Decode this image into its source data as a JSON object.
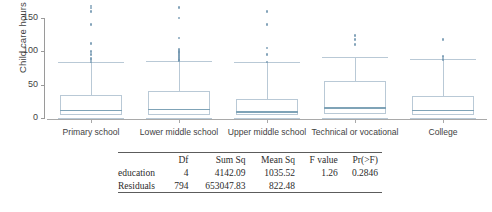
{
  "chart_data": {
    "type": "box",
    "title": "",
    "xlabel": "",
    "ylabel": "Child care hours",
    "ylim": [
      0,
      175
    ],
    "yticks": [
      0,
      50,
      100,
      150
    ],
    "ytick_labels": [
      "0",
      "50",
      "100",
      "150"
    ],
    "grid": false,
    "legend": "none",
    "categories": [
      "Primary school",
      "Lower middle school",
      "Upper middle school",
      "Technical or vocational",
      "College"
    ],
    "boxes": [
      {
        "category": "Primary school",
        "min": 0,
        "q1": 5,
        "median": 12,
        "q3": 35,
        "upper_whisker": 84,
        "outliers": [
          84,
          88,
          90,
          95,
          100,
          112,
          140,
          160,
          165,
          168
        ]
      },
      {
        "category": "Lower middle school",
        "min": 0,
        "q1": 5,
        "median": 14,
        "q3": 40,
        "upper_whisker": 86,
        "outliers": [
          86,
          88,
          90,
          92,
          95,
          98,
          100,
          103,
          120,
          150,
          166
        ]
      },
      {
        "category": "Upper middle school",
        "min": 0,
        "q1": 4,
        "median": 10,
        "q3": 28,
        "upper_whisker": 84,
        "outliers": [
          84,
          95,
          105,
          140,
          160
        ]
      },
      {
        "category": "Technical or vocational",
        "min": 0,
        "q1": 6,
        "median": 16,
        "q3": 56,
        "upper_whisker": 92,
        "outliers": [
          110,
          118,
          124
        ]
      },
      {
        "category": "College",
        "min": 0,
        "q1": 5,
        "median": 12,
        "q3": 33,
        "upper_whisker": 88,
        "outliers": [
          88,
          92,
          118
        ]
      }
    ]
  },
  "anova": {
    "columns": [
      "",
      "Df",
      "Sum Sq",
      "Mean Sq",
      "F value",
      "Pr(>F)"
    ],
    "rows": [
      {
        "term": "education",
        "df": "4",
        "sum_sq": "4142.09",
        "mean_sq": "1035.52",
        "f_value": "1.26",
        "p_value": "0.2846"
      },
      {
        "term": "Residuals",
        "df": "794",
        "sum_sq": "653047.83",
        "mean_sq": "822.48",
        "f_value": "",
        "p_value": ""
      }
    ]
  }
}
